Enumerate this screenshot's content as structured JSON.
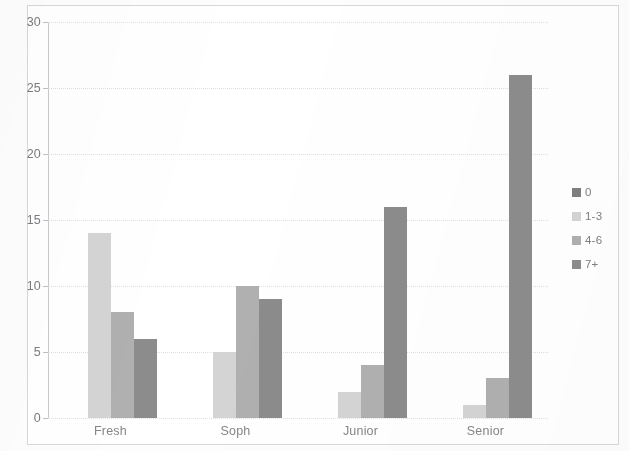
{
  "chart_data": {
    "type": "bar",
    "title": "",
    "subtitle": "",
    "xlabel": "",
    "ylabel": "",
    "categories": [
      "Fresh",
      "Soph",
      "Junior",
      "Senior"
    ],
    "series": [
      {
        "name": "0",
        "color": "#7f7f7f",
        "values": [
          0,
          0,
          0,
          0
        ]
      },
      {
        "name": "1-3",
        "color": "#d4d4d4",
        "values": [
          14,
          5,
          2,
          1
        ]
      },
      {
        "name": "4-6",
        "color": "#b0b0b0",
        "values": [
          8,
          10,
          4,
          3
        ]
      },
      {
        "name": "7+",
        "color": "#8c8c8c",
        "values": [
          6,
          9,
          16,
          26
        ]
      }
    ],
    "ylim": [
      0,
      30
    ],
    "yticks": [
      0,
      5,
      10,
      15,
      20,
      25,
      30
    ],
    "ytick_labels": [
      "0",
      "5",
      "10",
      "15",
      "20",
      "25",
      "30"
    ],
    "grid": true,
    "grid_axis": "y",
    "legend": true,
    "legend_position": "right",
    "legend_entries": [
      "0",
      "1-3",
      "4-6",
      "7+"
    ],
    "border_color": "#d8d8d8",
    "plot_background": "#ffffff",
    "gridline_color": "#dfdfe4",
    "axis_color": "#c9c9cf",
    "tick_label_color": "#7b7b80"
  }
}
